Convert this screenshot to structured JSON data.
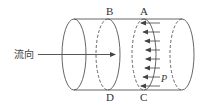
{
  "diagram": {
    "flow_label": "流向",
    "section_labels": {
      "top_left": "B",
      "top_right": "A",
      "bottom_left": "D",
      "bottom_right": "C"
    },
    "pressure_label": "P",
    "pressure_arrow_count": 8,
    "colors": {
      "stroke": "#555555",
      "text": "#333333",
      "background": "#ffffff"
    }
  }
}
